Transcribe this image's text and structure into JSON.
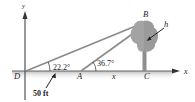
{
  "diagram": {
    "axes": {
      "x_label": "x",
      "y_label": "y"
    },
    "points": {
      "D": "D",
      "A": "A",
      "C": "C",
      "B": "B"
    },
    "angles": {
      "at_D": "22.2°",
      "at_A": "36.7°"
    },
    "distances": {
      "DA": "50 ft",
      "AC": "x"
    },
    "height_label": "h",
    "colors": {
      "line": "#8a8a8a",
      "tree": "#9a9a9a",
      "ground": "#c8c8c8",
      "axis": "#333333"
    }
  }
}
